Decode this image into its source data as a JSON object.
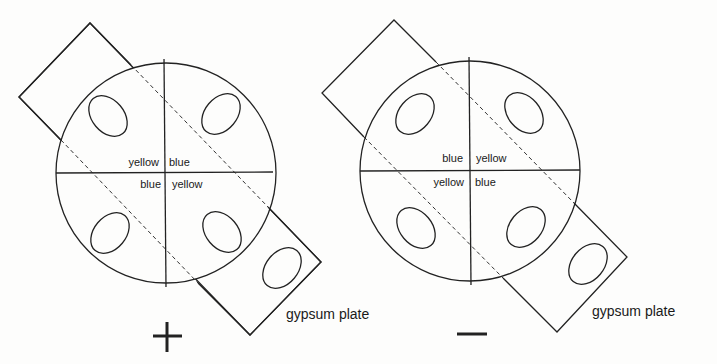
{
  "figure": {
    "panels": [
      {
        "sign": "+",
        "quadrant_labels": {
          "upper_left": "yellow",
          "upper_right": "blue",
          "lower_left": "blue",
          "lower_right": "yellow"
        },
        "plate_label": "gypsum plate"
      },
      {
        "sign": "—",
        "quadrant_labels": {
          "upper_left": "blue",
          "upper_right": "yellow",
          "lower_left": "yellow",
          "lower_right": "blue"
        },
        "plate_label": "gypsum plate"
      }
    ],
    "colors": {
      "line": "#222222",
      "background": "#fdfdfc"
    }
  }
}
